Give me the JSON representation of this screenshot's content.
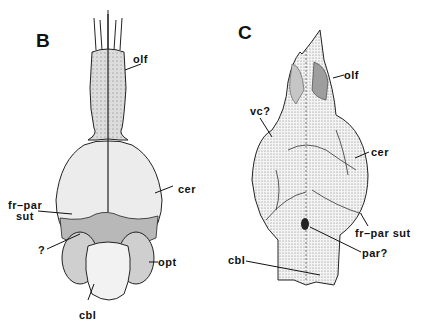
{
  "figure": {
    "panels": [
      {
        "letter": "B",
        "labels": {
          "olf": "olf",
          "cer": "cer",
          "fr_par_sut_line1": "fr–par",
          "fr_par_sut_line2": "sut",
          "question": "?",
          "opt": "opt",
          "cbl": "cbl"
        }
      },
      {
        "letter": "C",
        "labels": {
          "olf": "olf",
          "vc": "vc?",
          "cer": "cer",
          "fr_par_sut": "fr–par sut",
          "par": "par?",
          "cbl": "cbl"
        }
      }
    ],
    "colors": {
      "ink": "#111111",
      "shade": "#b8b8b8",
      "light": "#e4e4e4",
      "background": "#ffffff"
    }
  }
}
